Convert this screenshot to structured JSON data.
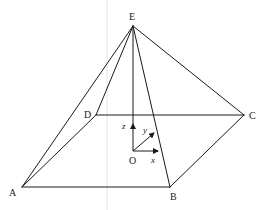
{
  "figure": {
    "vertices": {
      "A": {
        "label": "A",
        "x": 22,
        "y": 187
      },
      "B": {
        "label": "B",
        "x": 170,
        "y": 187
      },
      "C": {
        "label": "C",
        "x": 244,
        "y": 115
      },
      "D": {
        "label": "D",
        "x": 96,
        "y": 115
      },
      "E": {
        "label": "E",
        "x": 133,
        "y": 26
      },
      "O": {
        "label": "O",
        "x": 133,
        "y": 151
      }
    },
    "edges": [
      [
        "A",
        "B"
      ],
      [
        "B",
        "C"
      ],
      [
        "C",
        "D"
      ],
      [
        "D",
        "A"
      ],
      [
        "E",
        "A"
      ],
      [
        "E",
        "B"
      ],
      [
        "E",
        "C"
      ],
      [
        "E",
        "D"
      ],
      [
        "E",
        "O"
      ]
    ],
    "axes": {
      "x": {
        "label": "x",
        "to": [
          158,
          151
        ]
      },
      "y": {
        "label": "y",
        "to": [
          154,
          133
        ]
      },
      "z": {
        "label": "z",
        "to": [
          133,
          124
        ]
      }
    },
    "colors": {
      "line": "#1a1a1a",
      "background": "#ffffff"
    }
  }
}
